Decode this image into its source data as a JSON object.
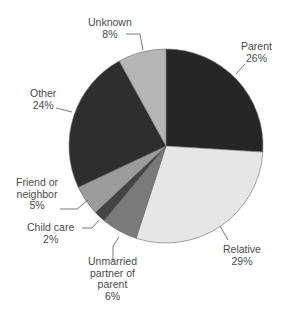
{
  "chart_data": {
    "type": "pie",
    "title": "",
    "start_angle_deg": 0,
    "direction": "clockwise",
    "slices": [
      {
        "label": "Parent",
        "value": 26,
        "display": "26%",
        "color": "#262626"
      },
      {
        "label": "Relative",
        "value": 29,
        "display": "29%",
        "color": "#e6e6e6"
      },
      {
        "label": "Unmarried partner of parent",
        "value": 6,
        "display": "6%",
        "color": "#7a7a7a"
      },
      {
        "label": "Child care",
        "value": 2,
        "display": "2%",
        "color": "#444444"
      },
      {
        "label": "Friend or neighbor",
        "value": 5,
        "display": "5%",
        "color": "#9c9c9c"
      },
      {
        "label": "Other",
        "value": 24,
        "display": "24%",
        "color": "#2e2e2e"
      },
      {
        "label": "Unknown",
        "value": 8,
        "display": "8%",
        "color": "#b5b5b5"
      }
    ],
    "legend": "none (direct labels with leader lines)"
  },
  "labels": {
    "parent": {
      "name": "Parent",
      "pct": "26%"
    },
    "relative": {
      "name": "Relative",
      "pct": "29%"
    },
    "unmarried": {
      "line1": "Unmarried",
      "line2": "partner of",
      "line3": "parent",
      "pct": "6%"
    },
    "childcare": {
      "name": "Child care",
      "pct": "2%"
    },
    "friend": {
      "line1": "Friend or",
      "line2": "neighbor",
      "pct": "5%"
    },
    "other": {
      "name": "Other",
      "pct": "24%"
    },
    "unknown": {
      "name": "Unknown",
      "pct": "8%"
    }
  }
}
